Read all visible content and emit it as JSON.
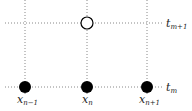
{
  "diagram": {
    "type": "finite-difference stencil",
    "time_levels": [
      {
        "id": "t_m",
        "label": "t",
        "sub": "m",
        "y": 87
      },
      {
        "id": "t_m+1",
        "label": "t",
        "sub": "m+1",
        "y": 23
      }
    ],
    "space_points": [
      {
        "id": "x_n-1",
        "label": "x",
        "sub": "n−1",
        "x": 25
      },
      {
        "id": "x_n",
        "label": "x",
        "sub": "n",
        "x": 87
      },
      {
        "id": "x_n+1",
        "label": "x",
        "sub": "n+1",
        "x": 147
      }
    ],
    "nodes": [
      {
        "x": 25,
        "y": 87,
        "filled": true
      },
      {
        "x": 87,
        "y": 87,
        "filled": true
      },
      {
        "x": 147,
        "y": 87,
        "filled": true
      },
      {
        "x": 87,
        "y": 23,
        "filled": false
      }
    ]
  }
}
